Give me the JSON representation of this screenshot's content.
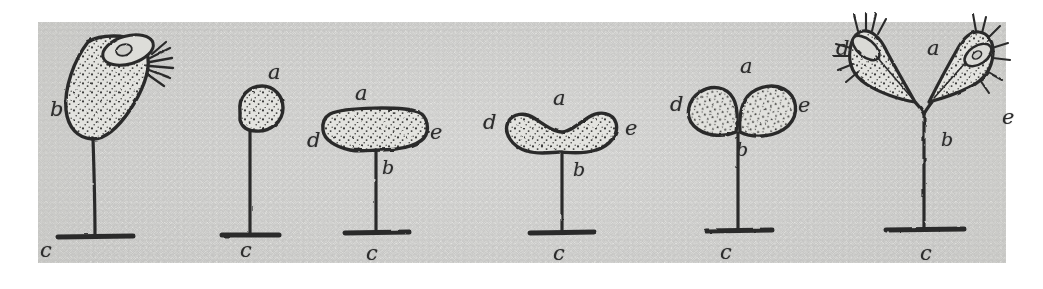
{
  "figure": {
    "kind": "scientific-line-drawing",
    "caption": "",
    "background_color": "#e9e9e6",
    "ink_color": "#2c2c2c",
    "panel_count": 6,
    "label_legend": [
      {
        "key": "a",
        "meaning": "apex / distal end of the cell body"
      },
      {
        "key": "b",
        "meaning": "stalk (pedicel) attaching cell body"
      },
      {
        "key": "c",
        "meaning": "basal attachment disc on substrate"
      },
      {
        "key": "d",
        "meaning": "left daughter lobe / left side of cell"
      },
      {
        "key": "e",
        "meaning": "right daughter lobe / right side of cell"
      }
    ],
    "stages": [
      {
        "index": 1,
        "name": "stage-1-mature-cell",
        "shape": "obliquely tilted flask-shaped cell with nucleus and ciliary tuft",
        "labels": [
          {
            "key": "b",
            "x": 50,
            "y": 99
          },
          {
            "key": "c",
            "x": 40,
            "y": 240
          }
        ]
      },
      {
        "index": 2,
        "name": "stage-2-rounded-bud",
        "shape": "small pear-shaped rounded cell",
        "labels": [
          {
            "key": "a",
            "x": 268,
            "y": 62
          },
          {
            "key": "c",
            "x": 240,
            "y": 240
          }
        ]
      },
      {
        "index": 3,
        "name": "stage-3-broad-cap",
        "shape": "broad flattened cap, widened transversely",
        "labels": [
          {
            "key": "a",
            "x": 355,
            "y": 83
          },
          {
            "key": "d",
            "x": 307,
            "y": 130
          },
          {
            "key": "e",
            "x": 430,
            "y": 122
          },
          {
            "key": "b",
            "x": 382,
            "y": 158
          },
          {
            "key": "c",
            "x": 366,
            "y": 243
          }
        ]
      },
      {
        "index": 4,
        "name": "stage-4-constricting-saddle",
        "shape": "saddle / dumbbell outline with median apical notch",
        "labels": [
          {
            "key": "a",
            "x": 553,
            "y": 88
          },
          {
            "key": "d",
            "x": 483,
            "y": 112
          },
          {
            "key": "e",
            "x": 625,
            "y": 118
          },
          {
            "key": "b",
            "x": 573,
            "y": 160
          },
          {
            "key": "c",
            "x": 553,
            "y": 243
          }
        ]
      },
      {
        "index": 5,
        "name": "stage-5-paired-lobes",
        "shape": "two ovoid daughter lobes joined at the stalk apex",
        "labels": [
          {
            "key": "a",
            "x": 740,
            "y": 56
          },
          {
            "key": "d",
            "x": 670,
            "y": 94
          },
          {
            "key": "e",
            "x": 798,
            "y": 95
          },
          {
            "key": "b",
            "x": 736,
            "y": 140
          },
          {
            "key": "c",
            "x": 720,
            "y": 242
          }
        ]
      },
      {
        "index": 6,
        "name": "stage-6-two-ciliated-daughters",
        "shape": "two splayed ciliated daughter cells, each with a nucleus, diverging from the stalk",
        "labels": [
          {
            "key": "d",
            "x": 836,
            "y": 38
          },
          {
            "key": "a",
            "x": 927,
            "y": 38
          },
          {
            "key": "e",
            "x": 1002,
            "y": 107
          },
          {
            "key": "b",
            "x": 941,
            "y": 130
          },
          {
            "key": "c",
            "x": 920,
            "y": 243
          }
        ]
      }
    ]
  }
}
